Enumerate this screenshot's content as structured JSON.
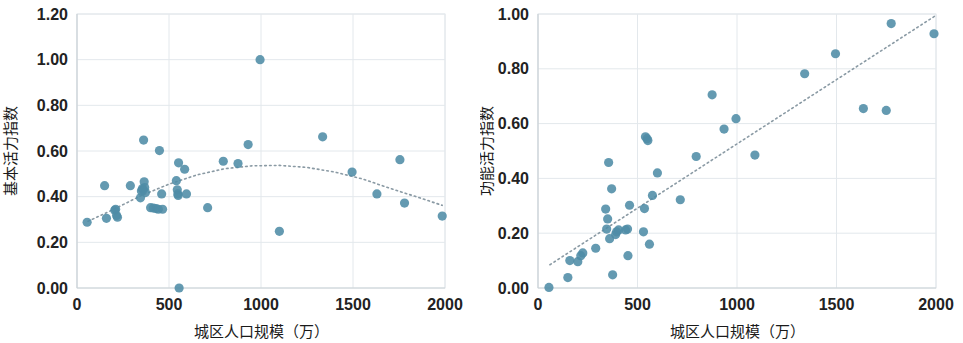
{
  "figure": {
    "background_color": "#ffffff",
    "marker_color": "#4e8ca6",
    "trendline_color": "#8a9aa4",
    "gridline_color": "#e3e8ec"
  },
  "panels": [
    {
      "id": "left",
      "name": "basic-vitality-scatter",
      "chart_data": {
        "type": "scatter",
        "title": "",
        "subtitle": "",
        "xlabel": "城区人口规模（万）",
        "ylabel": "基本活力指数",
        "xlim": [
          0,
          2000
        ],
        "ylim": [
          0,
          1.2
        ],
        "xticks": [
          0,
          500,
          1000,
          1500,
          2000
        ],
        "xtick_labels": [
          "0",
          "500",
          "1000",
          "1500",
          "2000"
        ],
        "yticks": [
          0.0,
          0.2,
          0.4,
          0.6,
          0.8,
          1.0,
          1.2
        ],
        "ytick_labels": [
          "0.00",
          "0.20",
          "0.40",
          "0.60",
          "0.80",
          "1.00",
          "1.20"
        ],
        "grid": true,
        "legend": "none",
        "series": [
          {
            "name": "城市",
            "marker": "circle",
            "color": "#4e8ca6",
            "points": [
              [
                55,
                0.288
              ],
              [
                150,
                0.448
              ],
              [
                160,
                0.305
              ],
              [
                205,
                0.34
              ],
              [
                210,
                0.345
              ],
              [
                215,
                0.318
              ],
              [
                220,
                0.31
              ],
              [
                290,
                0.448
              ],
              [
                345,
                0.395
              ],
              [
                350,
                0.425
              ],
              [
                355,
                0.435
              ],
              [
                360,
                0.43
              ],
              [
                362,
                0.648
              ],
              [
                365,
                0.465
              ],
              [
                368,
                0.44
              ],
              [
                372,
                0.418
              ],
              [
                400,
                0.352
              ],
              [
                415,
                0.35
              ],
              [
                430,
                0.348
              ],
              [
                442,
                0.345
              ],
              [
                448,
                0.602
              ],
              [
                460,
                0.412
              ],
              [
                465,
                0.345
              ],
              [
                540,
                0.47
              ],
              [
                545,
                0.43
              ],
              [
                548,
                0.412
              ],
              [
                550,
                0.405
              ],
              [
                552,
                0.548
              ],
              [
                555,
                0.0
              ],
              [
                585,
                0.52
              ],
              [
                595,
                0.412
              ],
              [
                710,
                0.352
              ],
              [
                795,
                0.555
              ],
              [
                875,
                0.545
              ],
              [
                930,
                0.628
              ],
              [
                995,
                1.0
              ],
              [
                1100,
                0.248
              ],
              [
                1335,
                0.662
              ],
              [
                1495,
                0.508
              ],
              [
                1630,
                0.412
              ],
              [
                1755,
                0.562
              ],
              [
                1780,
                0.372
              ],
              [
                1985,
                0.315
              ]
            ]
          }
        ],
        "trendline": {
          "type": "polynomial",
          "order": 2,
          "style": "dotted",
          "color": "#8a9aa4",
          "points": [
            [
              60,
              0.292
            ],
            [
              200,
              0.345
            ],
            [
              350,
              0.405
            ],
            [
              500,
              0.455
            ],
            [
              650,
              0.495
            ],
            [
              800,
              0.522
            ],
            [
              950,
              0.535
            ],
            [
              1100,
              0.537
            ],
            [
              1250,
              0.528
            ],
            [
              1400,
              0.508
            ],
            [
              1550,
              0.478
            ],
            [
              1700,
              0.437
            ],
            [
              1850,
              0.398
            ],
            [
              1985,
              0.362
            ]
          ]
        }
      }
    },
    {
      "id": "right",
      "name": "functional-vitality-scatter",
      "chart_data": {
        "type": "scatter",
        "title": "",
        "subtitle": "",
        "xlabel": "城区人口规模（万）",
        "ylabel": "功能活力指数",
        "xlim": [
          0,
          2000
        ],
        "ylim": [
          0,
          1.0
        ],
        "xticks": [
          0,
          500,
          1000,
          1500,
          2000
        ],
        "xtick_labels": [
          "0",
          "500",
          "1000",
          "1500",
          "2000"
        ],
        "yticks": [
          0.0,
          0.2,
          0.4,
          0.6,
          0.8,
          1.0
        ],
        "ytick_labels": [
          "0.00",
          "0.20",
          "0.40",
          "0.60",
          "0.80",
          "1.00"
        ],
        "grid": true,
        "legend": "none",
        "series": [
          {
            "name": "城市",
            "marker": "circle",
            "color": "#4e8ca6",
            "points": [
              [
                55,
                0.002
              ],
              [
                150,
                0.038
              ],
              [
                160,
                0.1
              ],
              [
                200,
                0.096
              ],
              [
                215,
                0.118
              ],
              [
                225,
                0.128
              ],
              [
                290,
                0.145
              ],
              [
                340,
                0.288
              ],
              [
                345,
                0.215
              ],
              [
                350,
                0.252
              ],
              [
                355,
                0.458
              ],
              [
                360,
                0.18
              ],
              [
                370,
                0.362
              ],
              [
                375,
                0.048
              ],
              [
                390,
                0.195
              ],
              [
                395,
                0.205
              ],
              [
                405,
                0.212
              ],
              [
                440,
                0.212
              ],
              [
                450,
                0.215
              ],
              [
                452,
                0.118
              ],
              [
                460,
                0.302
              ],
              [
                530,
                0.205
              ],
              [
                535,
                0.29
              ],
              [
                540,
                0.552
              ],
              [
                548,
                0.545
              ],
              [
                552,
                0.538
              ],
              [
                560,
                0.16
              ],
              [
                575,
                0.338
              ],
              [
                600,
                0.42
              ],
              [
                715,
                0.322
              ],
              [
                795,
                0.48
              ],
              [
                875,
                0.705
              ],
              [
                935,
                0.58
              ],
              [
                995,
                0.618
              ],
              [
                1090,
                0.485
              ],
              [
                1340,
                0.782
              ],
              [
                1495,
                0.855
              ],
              [
                1635,
                0.655
              ],
              [
                1750,
                0.648
              ],
              [
                1775,
                0.965
              ],
              [
                1990,
                0.928
              ]
            ]
          }
        ],
        "trendline": {
          "type": "linear",
          "style": "dotted",
          "color": "#8a9aa4",
          "points": [
            [
              60,
              0.085
            ],
            [
              2000,
              0.995
            ]
          ]
        }
      }
    }
  ]
}
